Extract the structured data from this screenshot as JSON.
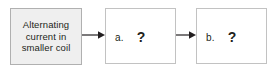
{
  "diagram": {
    "type": "flowchart",
    "orientation": "horizontal",
    "background_color": "#ffffff",
    "nodes": [
      {
        "id": "source",
        "kind": "given",
        "fill_color": "#efefef",
        "border_color": "#b0b0b0",
        "text_lines": [
          "Alternating",
          "current in",
          "smaller coil"
        ],
        "text_color": "#231f20"
      },
      {
        "id": "a",
        "kind": "answer-slot",
        "fill_color": "#ffffff",
        "border_color": "#c2c2c2",
        "label": "a.",
        "placeholder": "?",
        "text_color": "#231f20"
      },
      {
        "id": "b",
        "kind": "answer-slot",
        "fill_color": "#ffffff",
        "border_color": "#c2c2c2",
        "label": "b.",
        "placeholder": "?",
        "text_color": "#231f20"
      }
    ],
    "connectors": [
      {
        "id": "arrow-1",
        "from": "source",
        "to": "a",
        "style": "solid-arrow",
        "color": "#231f20"
      },
      {
        "id": "arrow-2",
        "from": "a",
        "to": "b",
        "style": "solid-arrow",
        "color": "#231f20"
      }
    ]
  }
}
